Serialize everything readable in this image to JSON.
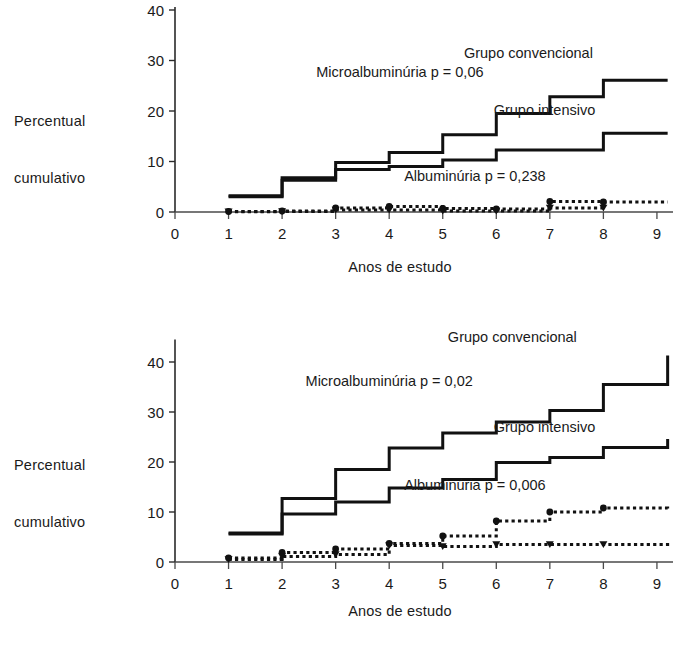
{
  "figure": {
    "background": "#ffffff",
    "ink": "#111111"
  },
  "chart_data": [
    {
      "id": "top",
      "type": "line",
      "step": "post",
      "title": "",
      "xlabel": "Anos de estudo",
      "ylabel": "Percentual cumulativo",
      "ylabel_line1": "Percentual",
      "ylabel_line2": "cumulativo",
      "xlim": [
        0,
        9.3
      ],
      "ylim": [
        0,
        40
      ],
      "xticks": [
        0,
        1,
        2,
        3,
        4,
        5,
        6,
        7,
        8,
        9
      ],
      "xticklabels": [
        "0",
        "1",
        "2",
        "3",
        "4",
        "5",
        "6",
        "7",
        "8",
        "9"
      ],
      "yticks": [
        0,
        10,
        20,
        30,
        40
      ],
      "yticklabels": [
        "0",
        "10",
        "20",
        "30",
        "40"
      ],
      "grid": false,
      "legend_position": "inline-annotations",
      "annotations": [
        {
          "text": "Grupo convencional",
          "x": 6.6,
          "y": 30.5
        },
        {
          "text": "Microalbuminúria p = 0,06",
          "x": 4.2,
          "y": 26.8
        },
        {
          "text": "Grupo intensivo",
          "x": 6.9,
          "y": 19.2
        },
        {
          "text": "Albuminúria p = 0,238",
          "x": 5.6,
          "y": 6.2
        }
      ],
      "series": [
        {
          "name": "Microalbuminúria - Grupo convencional",
          "style": "solid",
          "x": [
            1,
            2,
            3,
            4,
            5,
            6,
            7,
            8,
            9.2
          ],
          "values": [
            3.2,
            6.8,
            9.8,
            11.8,
            15.3,
            19.5,
            22.8,
            26.1,
            26.1
          ]
        },
        {
          "name": "Microalbuminúria - Grupo intensivo",
          "style": "solid",
          "x": [
            1,
            2,
            3,
            4,
            5,
            6,
            7,
            8,
            9.2
          ],
          "values": [
            3.0,
            6.3,
            8.4,
            9.0,
            10.3,
            12.3,
            12.3,
            15.6,
            15.6
          ]
        },
        {
          "name": "Albuminúria - Grupo convencional",
          "style": "dotted",
          "marker": "circle",
          "x": [
            1,
            2,
            3,
            4,
            5,
            6,
            7,
            8,
            9.2
          ],
          "values": [
            0.1,
            0.2,
            0.8,
            1.1,
            0.7,
            0.6,
            2.1,
            2.0,
            2.0
          ]
        },
        {
          "name": "Albuminúria - Grupo intensivo",
          "style": "dotted",
          "marker": "triangle-down",
          "x": [
            1,
            2,
            3,
            4,
            5,
            6,
            7,
            8
          ],
          "values": [
            0.05,
            0.1,
            0.4,
            0.4,
            0.2,
            0.2,
            0.8,
            0.8
          ]
        }
      ]
    },
    {
      "id": "bottom",
      "type": "line",
      "step": "post",
      "title": "",
      "xlabel": "Anos de estudo",
      "ylabel": "Percentual cumulativo",
      "ylabel_line1": "Percentual",
      "ylabel_line2": "cumulativo",
      "xlim": [
        0,
        9.3
      ],
      "ylim": [
        0,
        45
      ],
      "xticks": [
        0,
        1,
        2,
        3,
        4,
        5,
        6,
        7,
        8,
        9
      ],
      "xticklabels": [
        "0",
        "1",
        "2",
        "3",
        "4",
        "5",
        "6",
        "7",
        "8",
        "9"
      ],
      "yticks": [
        0,
        10,
        20,
        30,
        40
      ],
      "yticklabels": [
        "0",
        "10",
        "20",
        "30",
        "40"
      ],
      "grid": false,
      "legend_position": "inline-annotations",
      "annotations": [
        {
          "text": "Grupo convencional",
          "x": 6.3,
          "y": 44.0
        },
        {
          "text": "Microalbuminúria p = 0,02",
          "x": 4.0,
          "y": 35.2
        },
        {
          "text": "Grupo intensivo",
          "x": 6.9,
          "y": 26.0
        },
        {
          "text": "Albuminúria p = 0,006",
          "x": 5.6,
          "y": 14.4
        }
      ],
      "series": [
        {
          "name": "Microalbuminúria - Grupo convencional",
          "style": "solid",
          "x": [
            1,
            2,
            3,
            4,
            5,
            6,
            7,
            8,
            9.2
          ],
          "values": [
            5.8,
            12.7,
            18.5,
            22.8,
            25.8,
            28.0,
            30.3,
            35.5,
            41.3
          ]
        },
        {
          "name": "Microalbuminúria - Grupo intensivo",
          "style": "solid",
          "x": [
            1,
            2,
            3,
            4,
            5,
            6,
            7,
            8,
            9.2
          ],
          "values": [
            5.6,
            9.6,
            12.0,
            14.8,
            16.5,
            19.9,
            20.9,
            22.9,
            24.6
          ]
        },
        {
          "name": "Albuminúria - Grupo convencional",
          "style": "dotted",
          "marker": "circle",
          "x": [
            1,
            2,
            3,
            4,
            5,
            6,
            7,
            8,
            9.2
          ],
          "values": [
            0.8,
            1.9,
            2.6,
            3.7,
            5.2,
            8.2,
            10.0,
            10.8,
            10.7
          ]
        },
        {
          "name": "Albuminúria - Grupo intensivo",
          "style": "dotted",
          "marker": "triangle-down",
          "x": [
            1,
            2,
            3,
            4,
            5,
            6,
            7,
            8,
            9.2
          ],
          "values": [
            0.5,
            1.1,
            1.5,
            3.3,
            3.1,
            3.5,
            3.5,
            3.5,
            4.4
          ]
        }
      ]
    }
  ]
}
